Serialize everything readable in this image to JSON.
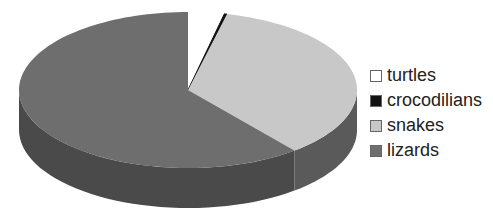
{
  "chart_data": {
    "type": "pie",
    "style": "3d",
    "title": "",
    "categories": [
      "turtles",
      "crocodilians",
      "snakes",
      "lizards"
    ],
    "values": [
      341,
      25,
      3496,
      6000
    ],
    "percent_estimate": [
      3.5,
      0.3,
      35.5,
      60.7
    ],
    "colors": [
      "#ffffff",
      "#111111",
      "#c8c8c8",
      "#6e6e6e"
    ],
    "side_colors": [
      "#e0e0e0",
      "#000000",
      "#5a5a5a",
      "#4a4a4a"
    ],
    "start_angle_deg": 0,
    "direction": "clockwise",
    "legend_position": "right"
  },
  "legend": {
    "items": [
      {
        "label": "turtles",
        "color": "#ffffff"
      },
      {
        "label": "crocodilians",
        "color": "#111111"
      },
      {
        "label": "snakes",
        "color": "#c8c8c8"
      },
      {
        "label": "lizards",
        "color": "#6e6e6e"
      }
    ]
  }
}
